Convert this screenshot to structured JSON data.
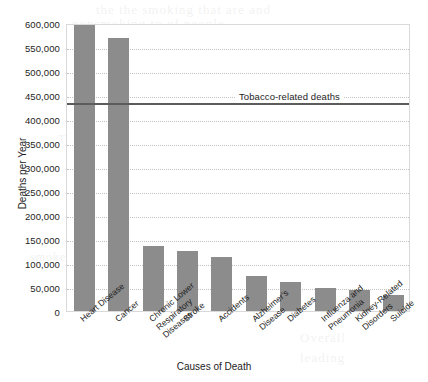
{
  "chart_data": {
    "type": "bar",
    "title": "",
    "xlabel": "Causes of Death",
    "ylabel": "Deaths per Year",
    "categories": [
      "Heart Disease",
      "Cancer",
      "Chronic Lower\nRespiratory\nDiseases",
      "Stroke",
      "Accidents",
      "Alzheimer's\nDisease",
      "Diabetes",
      "Influenza and\nPneumonia",
      "Kidney-Related\nDisorders",
      "Suicide"
    ],
    "values": [
      598000,
      568000,
      135000,
      124000,
      112000,
      72000,
      61000,
      48000,
      44000,
      33000
    ],
    "ylim": [
      0,
      600000
    ],
    "ytick_step": 50000,
    "ytick_labels": [
      "600,000",
      "550,000",
      "500,000",
      "450,000",
      "400,000",
      "350,000",
      "300,000",
      "250,000",
      "200,000",
      "150,000",
      "100,000",
      "50,000",
      "0"
    ],
    "ytick_values": [
      600000,
      550000,
      500000,
      450000,
      400000,
      350000,
      300000,
      250000,
      200000,
      150000,
      100000,
      50000,
      0
    ],
    "grid": true,
    "legend": "none",
    "bar_color": "#8c8c8c",
    "reference_line": {
      "label": "Tobacco-related deaths",
      "value": 435000,
      "color": "#5c5c5c"
    }
  },
  "bleed_text": [
    {
      "text": "the the smoking that are and",
      "x": 96,
      "y": 2,
      "size": 13
    },
    {
      "text": "nonsmoking to of people",
      "x": 72,
      "y": 16,
      "size": 13
    },
    {
      "text": "deaths from second for",
      "x": 148,
      "y": 38,
      "size": 12
    },
    {
      "text": "Tobacco use will also",
      "x": 58,
      "y": 132,
      "size": 12
    },
    {
      "text": "causes of death in the",
      "x": 170,
      "y": 160,
      "size": 12
    },
    {
      "text": "and the rates",
      "x": 210,
      "y": 208,
      "size": 12
    },
    {
      "text": "smoke exposure",
      "x": 30,
      "y": 250,
      "size": 12
    },
    {
      "text": "Overall",
      "x": 300,
      "y": 330,
      "size": 13
    },
    {
      "text": "leading",
      "x": 300,
      "y": 350,
      "size": 13
    }
  ]
}
